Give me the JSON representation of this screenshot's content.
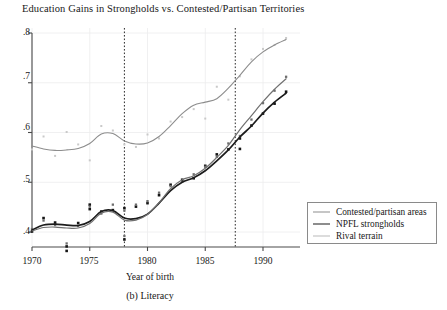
{
  "chart_data": {
    "type": "scatter",
    "title": "Education Gains in Strongholds vs. Contested/Partisan Territories",
    "xlabel": "Year of birth",
    "ylabel": "",
    "caption": "(b) Literacy",
    "xlim": [
      1969.5,
      1992.5
    ],
    "ylim": [
      0.355,
      0.81
    ],
    "xticks": [
      1970,
      1975,
      1980,
      1985,
      1990
    ],
    "xtick_labels": [
      "1970",
      "1975",
      "1980",
      "1985",
      "1990"
    ],
    "yticks": [
      0.4,
      0.5,
      0.6,
      0.7,
      0.8
    ],
    "ytick_labels": [
      ".4",
      ".5",
      ".6",
      ".7",
      ".8"
    ],
    "grid": true,
    "legend_position": "bottom-right",
    "vertical_reference_lines": [
      1978.0,
      1987.6
    ],
    "series": [
      {
        "name": "Contested/partisan areas",
        "color": "#8d8d8d",
        "line_width": 1.1,
        "marker": "none",
        "x": [
          1970,
          1971,
          1972,
          1973,
          1974,
          1975,
          1976,
          1977,
          1978,
          1979,
          1980,
          1981,
          1982,
          1983,
          1984,
          1985,
          1986,
          1987,
          1988,
          1989,
          1990,
          1991,
          1992
        ],
        "values": [
          0.573,
          0.567,
          0.564,
          0.565,
          0.568,
          0.578,
          0.597,
          0.598,
          0.583,
          0.577,
          0.579,
          0.592,
          0.614,
          0.638,
          0.655,
          0.661,
          0.668,
          0.689,
          0.715,
          0.742,
          0.762,
          0.776,
          0.787
        ]
      },
      {
        "name": "NPFL strongholds",
        "color": "#1c1c1c",
        "line_width": 1.7,
        "marker": "filled-square",
        "x": [
          1970,
          1971,
          1972,
          1973,
          1974,
          1975,
          1976,
          1977,
          1978,
          1979,
          1980,
          1981,
          1982,
          1983,
          1984,
          1985,
          1986,
          1987,
          1988,
          1989,
          1990,
          1991,
          1992
        ],
        "values": [
          0.404,
          0.414,
          0.416,
          0.414,
          0.413,
          0.421,
          0.441,
          0.443,
          0.428,
          0.427,
          0.436,
          0.458,
          0.483,
          0.5,
          0.509,
          0.523,
          0.543,
          0.565,
          0.591,
          0.613,
          0.639,
          0.661,
          0.679
        ]
      },
      {
        "name": "Rival terrain",
        "color": "#707070",
        "line_width": 1.2,
        "marker": "gray-square",
        "x": [
          1970,
          1971,
          1972,
          1973,
          1974,
          1975,
          1976,
          1977,
          1978,
          1979,
          1980,
          1981,
          1982,
          1983,
          1984,
          1985,
          1986,
          1987,
          1988,
          1989,
          1990,
          1991,
          1992
        ],
        "values": [
          0.402,
          0.409,
          0.41,
          0.408,
          0.408,
          0.417,
          0.438,
          0.44,
          0.424,
          0.424,
          0.435,
          0.459,
          0.487,
          0.505,
          0.513,
          0.528,
          0.55,
          0.574,
          0.606,
          0.634,
          0.662,
          0.687,
          0.708
        ]
      }
    ],
    "scatter_points": [
      {
        "group": "contested",
        "x": 1970,
        "y": 0.566
      },
      {
        "group": "contested",
        "x": 1971,
        "y": 0.592
      },
      {
        "group": "contested",
        "x": 1972,
        "y": 0.553
      },
      {
        "group": "contested",
        "x": 1973,
        "y": 0.601
      },
      {
        "group": "contested",
        "x": 1974,
        "y": 0.576
      },
      {
        "group": "contested",
        "x": 1975,
        "y": 0.544
      },
      {
        "group": "contested",
        "x": 1976,
        "y": 0.613
      },
      {
        "group": "contested",
        "x": 1977,
        "y": 0.604
      },
      {
        "group": "contested",
        "x": 1978,
        "y": 0.576
      },
      {
        "group": "contested",
        "x": 1979,
        "y": 0.571
      },
      {
        "group": "contested",
        "x": 1980,
        "y": 0.596
      },
      {
        "group": "contested",
        "x": 1981,
        "y": 0.588
      },
      {
        "group": "contested",
        "x": 1982,
        "y": 0.622
      },
      {
        "group": "contested",
        "x": 1983,
        "y": 0.631
      },
      {
        "group": "contested",
        "x": 1984,
        "y": 0.647
      },
      {
        "group": "contested",
        "x": 1985,
        "y": 0.628
      },
      {
        "group": "contested",
        "x": 1986,
        "y": 0.692
      },
      {
        "group": "contested",
        "x": 1987,
        "y": 0.666
      },
      {
        "group": "contested",
        "x": 1988,
        "y": 0.713
      },
      {
        "group": "contested",
        "x": 1989,
        "y": 0.747
      },
      {
        "group": "contested",
        "x": 1990,
        "y": 0.768
      },
      {
        "group": "contested",
        "x": 1991,
        "y": 0.776
      },
      {
        "group": "contested",
        "x": 1992,
        "y": 0.79
      },
      {
        "group": "npfl",
        "x": 1970,
        "y": 0.401
      },
      {
        "group": "npfl",
        "x": 1971,
        "y": 0.428
      },
      {
        "group": "npfl",
        "x": 1972,
        "y": 0.419
      },
      {
        "group": "npfl",
        "x": 1973,
        "y": 0.371
      },
      {
        "group": "npfl",
        "x": 1973,
        "y": 0.362
      },
      {
        "group": "npfl",
        "x": 1974,
        "y": 0.418
      },
      {
        "group": "npfl",
        "x": 1975,
        "y": 0.446
      },
      {
        "group": "npfl",
        "x": 1975,
        "y": 0.455
      },
      {
        "group": "npfl",
        "x": 1976,
        "y": 0.441
      },
      {
        "group": "npfl",
        "x": 1977,
        "y": 0.444
      },
      {
        "group": "npfl",
        "x": 1978,
        "y": 0.448
      },
      {
        "group": "npfl",
        "x": 1978,
        "y": 0.385
      },
      {
        "group": "npfl",
        "x": 1979,
        "y": 0.451
      },
      {
        "group": "npfl",
        "x": 1980,
        "y": 0.458
      },
      {
        "group": "npfl",
        "x": 1981,
        "y": 0.474
      },
      {
        "group": "npfl",
        "x": 1982,
        "y": 0.495
      },
      {
        "group": "npfl",
        "x": 1983,
        "y": 0.505
      },
      {
        "group": "npfl",
        "x": 1984,
        "y": 0.508
      },
      {
        "group": "npfl",
        "x": 1985,
        "y": 0.533
      },
      {
        "group": "npfl",
        "x": 1986,
        "y": 0.556
      },
      {
        "group": "npfl",
        "x": 1987,
        "y": 0.566
      },
      {
        "group": "npfl",
        "x": 1988,
        "y": 0.588
      },
      {
        "group": "npfl",
        "x": 1988,
        "y": 0.567
      },
      {
        "group": "npfl",
        "x": 1989,
        "y": 0.614
      },
      {
        "group": "npfl",
        "x": 1990,
        "y": 0.638
      },
      {
        "group": "npfl",
        "x": 1991,
        "y": 0.658
      },
      {
        "group": "npfl",
        "x": 1992,
        "y": 0.682
      },
      {
        "group": "rival",
        "x": 1970,
        "y": 0.406
      },
      {
        "group": "rival",
        "x": 1971,
        "y": 0.423
      },
      {
        "group": "rival",
        "x": 1972,
        "y": 0.414
      },
      {
        "group": "rival",
        "x": 1973,
        "y": 0.377
      },
      {
        "group": "rival",
        "x": 1974,
        "y": 0.412
      },
      {
        "group": "rival",
        "x": 1975,
        "y": 0.451
      },
      {
        "group": "rival",
        "x": 1976,
        "y": 0.437
      },
      {
        "group": "rival",
        "x": 1977,
        "y": 0.455
      },
      {
        "group": "rival",
        "x": 1978,
        "y": 0.443
      },
      {
        "group": "rival",
        "x": 1978,
        "y": 0.392
      },
      {
        "group": "rival",
        "x": 1979,
        "y": 0.455
      },
      {
        "group": "rival",
        "x": 1980,
        "y": 0.462
      },
      {
        "group": "rival",
        "x": 1981,
        "y": 0.479
      },
      {
        "group": "rival",
        "x": 1982,
        "y": 0.492
      },
      {
        "group": "rival",
        "x": 1983,
        "y": 0.501
      },
      {
        "group": "rival",
        "x": 1984,
        "y": 0.516
      },
      {
        "group": "rival",
        "x": 1985,
        "y": 0.531
      },
      {
        "group": "rival",
        "x": 1986,
        "y": 0.551
      },
      {
        "group": "rival",
        "x": 1987,
        "y": 0.578
      },
      {
        "group": "rival",
        "x": 1988,
        "y": 0.593
      },
      {
        "group": "rival",
        "x": 1989,
        "y": 0.626
      },
      {
        "group": "rival",
        "x": 1990,
        "y": 0.659
      },
      {
        "group": "rival",
        "x": 1991,
        "y": 0.684
      },
      {
        "group": "rival",
        "x": 1992,
        "y": 0.712
      }
    ]
  },
  "legend": {
    "entries": [
      {
        "label": "Contested/partisan areas"
      },
      {
        "label": "NPFL strongholds"
      },
      {
        "label": "Rival terrain"
      }
    ]
  }
}
